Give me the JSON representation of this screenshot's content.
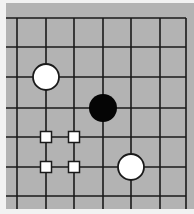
{
  "board": {
    "background_color": "#b3b3b3",
    "page_color": "#f2f2f2",
    "line_color": "#1a1a1a",
    "area": {
      "x": 6,
      "y": 3,
      "width": 188,
      "height": 206
    },
    "vertical_lines_x": [
      17,
      46,
      74,
      103,
      131,
      160,
      186
    ],
    "horizontal_lines_y": [
      18,
      47,
      77,
      108,
      137,
      167,
      196
    ],
    "grid_right_edge_x": 186,
    "grid_top_edge_y": 18
  },
  "stones": [
    {
      "color": "white",
      "col": 1,
      "row": 2,
      "cx": 46,
      "cy": 77,
      "r": 13
    },
    {
      "color": "black",
      "col": 3,
      "row": 3,
      "cx": 103,
      "cy": 108,
      "r": 14
    },
    {
      "color": "white",
      "col": 4,
      "row": 5,
      "cx": 131,
      "cy": 167,
      "r": 13
    }
  ],
  "markers": [
    {
      "shape": "square",
      "col": 1,
      "row": 4,
      "cx": 46,
      "cy": 137,
      "size": 11
    },
    {
      "shape": "square",
      "col": 2,
      "row": 4,
      "cx": 74,
      "cy": 137,
      "size": 11
    },
    {
      "shape": "square",
      "col": 1,
      "row": 5,
      "cx": 46,
      "cy": 167,
      "size": 11
    },
    {
      "shape": "square",
      "col": 2,
      "row": 5,
      "cx": 74,
      "cy": 167,
      "size": 11
    }
  ]
}
